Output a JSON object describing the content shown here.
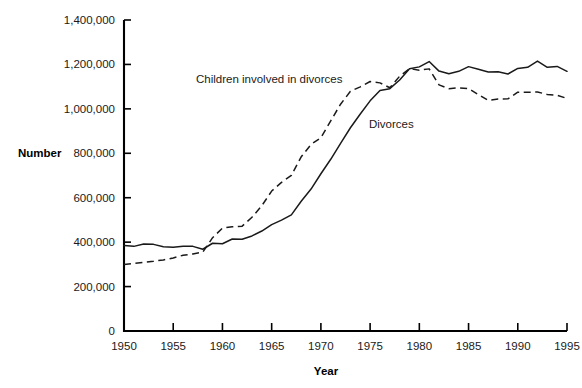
{
  "chart_data": {
    "type": "line",
    "title": "",
    "xlabel": "Year",
    "ylabel": "Number",
    "xlim": [
      1950,
      1995
    ],
    "ylim": [
      0,
      1400000
    ],
    "grid": false,
    "legend_position": "inline-annotations",
    "x_ticks": [
      1950,
      1955,
      1960,
      1965,
      1970,
      1975,
      1980,
      1985,
      1990,
      1995
    ],
    "x_tick_labels": [
      "1950",
      "1955",
      "1960",
      "1965",
      "1970",
      "1975",
      "1980",
      "1985",
      "1990",
      "1995"
    ],
    "y_ticks": [
      0,
      200000,
      400000,
      600000,
      800000,
      1000000,
      1200000,
      1400000
    ],
    "y_tick_labels": [
      "0",
      "200,000",
      "400,000",
      "600,000",
      "800,000",
      "1,000,000",
      "1,200,000",
      "1,400,000"
    ],
    "x": [
      1950,
      1951,
      1952,
      1953,
      1954,
      1955,
      1956,
      1957,
      1958,
      1959,
      1960,
      1961,
      1962,
      1963,
      1964,
      1965,
      1966,
      1967,
      1968,
      1969,
      1970,
      1971,
      1972,
      1973,
      1974,
      1975,
      1976,
      1977,
      1978,
      1979,
      1980,
      1981,
      1982,
      1983,
      1984,
      1985,
      1986,
      1987,
      1988,
      1989,
      1990,
      1991,
      1992,
      1993,
      1994,
      1995
    ],
    "series": [
      {
        "name": "Divorces",
        "style": "solid",
        "annotation": "Divorces",
        "values": [
          385000,
          381000,
          392000,
          390000,
          379000,
          377000,
          382000,
          381000,
          368000,
          395000,
          393000,
          414000,
          413000,
          428000,
          450000,
          479000,
          499000,
          523000,
          584000,
          639000,
          708000,
          773000,
          845000,
          915000,
          977000,
          1036000,
          1083000,
          1091000,
          1130000,
          1181000,
          1189000,
          1213000,
          1170000,
          1158000,
          1169000,
          1190000,
          1178000,
          1166000,
          1167000,
          1157000,
          1182000,
          1187000,
          1215000,
          1187000,
          1191000,
          1169000
        ]
      },
      {
        "name": "Children involved in divorces",
        "style": "dashed",
        "annotation": "Children involved in divorces",
        "values": [
          299000,
          304000,
          309000,
          314000,
          320000,
          329000,
          341000,
          347000,
          355000,
          420000,
          463000,
          469000,
          472000,
          512000,
          564000,
          630000,
          669000,
          701000,
          784000,
          840000,
          870000,
          946000,
          1021000,
          1079000,
          1099000,
          1123000,
          1117000,
          1095000,
          1147000,
          1181000,
          1174000,
          1180000,
          1108000,
          1091000,
          1095000,
          1091000,
          1064000,
          1038000,
          1044000,
          1045000,
          1075000,
          1075000,
          1076000,
          1065000,
          1061000,
          1047000
        ]
      }
    ]
  },
  "axes": {
    "y_axis_title": "Number",
    "x_axis_title": "Year"
  }
}
